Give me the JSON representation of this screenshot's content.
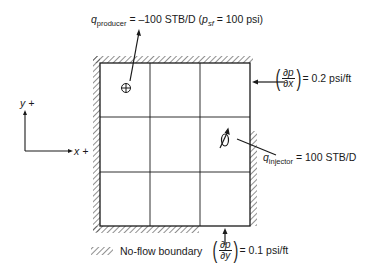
{
  "diagram": {
    "producer_label": {
      "symbol": "q",
      "subscript": "producer",
      "text": "= –100 STB/D (",
      "pressure_symbol": "p",
      "pressure_subscript": "sf",
      "pressure_text": "= 100 psi)"
    },
    "injector_label": {
      "symbol": "q",
      "subscript": "injector",
      "text": "= 100 STB/D"
    },
    "gradient_x": {
      "numerator": "∂p",
      "denominator": "∂x",
      "value": "= 0.2 psi/ft"
    },
    "gradient_y": {
      "numerator": "∂p",
      "denominator": "∂y",
      "value": "= 0.1 psi/ft"
    },
    "axes": {
      "x_label": "x +",
      "y_label": "y +"
    },
    "legend": {
      "no_flow_label": "No-flow boundary"
    },
    "grid": {
      "rows": 3,
      "cols": 3
    },
    "colors": {
      "line": "#1a1a1a",
      "hatch": "#333333"
    }
  }
}
